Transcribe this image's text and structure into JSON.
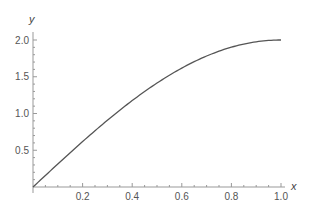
{
  "chart_data": {
    "type": "line",
    "title": "",
    "xlabel": "x",
    "ylabel": "y",
    "xlim": [
      0,
      1.0
    ],
    "ylim": [
      0,
      2.0
    ],
    "grid": false,
    "x_ticks": [
      "0.2",
      "0.4",
      "0.6",
      "0.8",
      "1.0"
    ],
    "y_ticks": [
      "0.5",
      "1.0",
      "1.5",
      "2.0"
    ],
    "series": [
      {
        "name": "y = 2 sin(πx/2)",
        "color": "#555555",
        "x": [
          0,
          0.1,
          0.2,
          0.3,
          0.4,
          0.5,
          0.6,
          0.7,
          0.8,
          0.9,
          1.0
        ],
        "values": [
          0,
          0.313,
          0.618,
          0.908,
          1.176,
          1.414,
          1.618,
          1.782,
          1.902,
          1.975,
          2.0
        ]
      }
    ]
  }
}
